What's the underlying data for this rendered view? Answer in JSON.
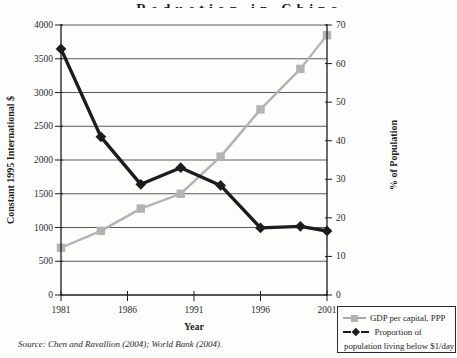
{
  "title": "Reduction in China",
  "source": "Source: Chen and Ravallion (2004);  World Bank (2004).",
  "chart_data": {
    "type": "line",
    "title_visible_fragment": "Reduction in China",
    "x": [
      1981,
      1984,
      1987,
      1990,
      1993,
      1996,
      1999,
      2001
    ],
    "x_ticks": [
      1981,
      1986,
      1991,
      1996,
      2001
    ],
    "xlabel": "Year",
    "left_axis": {
      "label": "Constant 1995 International $",
      "min": 0,
      "max": 4000,
      "step": 500,
      "ticks": [
        4000,
        3500,
        3000,
        2500,
        2000,
        1500,
        1000,
        500,
        0
      ]
    },
    "right_axis": {
      "label": "% of Population",
      "min": 0,
      "max": 70,
      "step": 10,
      "ticks": [
        70,
        60,
        50,
        40,
        30,
        20,
        10,
        0
      ]
    },
    "series": [
      {
        "name": "GDP per capital, PPP",
        "axis": "left",
        "marker": "square",
        "color": "#b3b3b3",
        "values": [
          700,
          950,
          1280,
          1500,
          2050,
          2750,
          3350,
          3850
        ]
      },
      {
        "name": "Proportion of population living below $1/day",
        "axis": "right",
        "marker": "diamond",
        "color": "#1c1c1c",
        "values": [
          63.8,
          41.0,
          28.7,
          33.0,
          28.4,
          17.4,
          17.8,
          16.6
        ]
      }
    ],
    "grid": "horizontal lines at every 500 of left axis",
    "legend_position": "bottom-right below plot"
  },
  "legend": {
    "item1_label": "GDP per capital, PPP",
    "item2_label_line1": "Proportion of",
    "item2_label_line2": "population living below $1/day"
  }
}
